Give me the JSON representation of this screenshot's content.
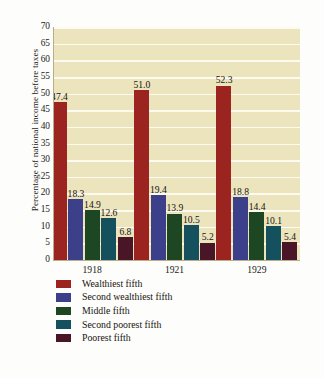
{
  "chart_data": {
    "type": "bar",
    "title": "",
    "subtitle": "",
    "xlabel": "",
    "ylabel": "Percentage of national income before taxes",
    "categories": [
      "1918",
      "1921",
      "1929"
    ],
    "ylim": [
      0,
      70
    ],
    "ytick_step": 5,
    "yticks": [
      "70",
      "65",
      "60",
      "55",
      "50",
      "45",
      "40",
      "35",
      "30",
      "25",
      "20",
      "15",
      "10",
      "5",
      "0"
    ],
    "grid": "horizontal",
    "legend_position": "bottom-left",
    "series": [
      {
        "name": "Wealthiest fifth",
        "color": "#9c2420",
        "values": [
          47.4,
          51.0,
          52.3
        ],
        "labels": [
          "47.4",
          "51.0",
          "52.3"
        ]
      },
      {
        "name": "Second wealthiest fifth",
        "color": "#3c3f89",
        "values": [
          18.3,
          19.4,
          18.8
        ],
        "labels": [
          "18.3",
          "19.4",
          "18.8"
        ]
      },
      {
        "name": "Middle fifth",
        "color": "#1d4722",
        "values": [
          14.9,
          13.9,
          14.4
        ],
        "labels": [
          "14.9",
          "13.9",
          "14.4"
        ]
      },
      {
        "name": "Second poorest fifth",
        "color": "#15505e",
        "values": [
          12.6,
          10.5,
          10.1
        ],
        "labels": [
          "12.6",
          "10.5",
          "10.1"
        ]
      },
      {
        "name": "Poorest fifth",
        "color": "#4b1528",
        "values": [
          6.8,
          5.2,
          5.4
        ],
        "labels": [
          "6.8",
          "5.2",
          "5.4"
        ]
      }
    ],
    "colors": {
      "plot_background": "#ece4bd",
      "gridline": "#fdfaf0",
      "axis": "#b9ae87",
      "text": "#17140f"
    }
  }
}
